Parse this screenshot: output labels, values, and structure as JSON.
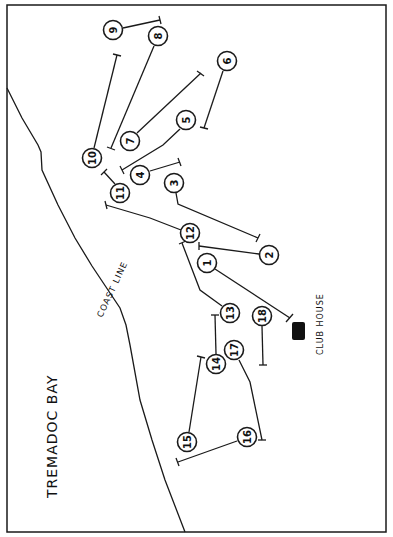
{
  "map": {
    "labels": {
      "bay": "TREMADOC BAY",
      "coast": "COAST LINE",
      "clubhouse": "CLUB HOUSE"
    },
    "colors": {
      "ink": "#1a1a1a",
      "paper": "#ffffff"
    },
    "holes": [
      {
        "n": "1",
        "x": 207,
        "y": 263
      },
      {
        "n": "2",
        "x": 269,
        "y": 255
      },
      {
        "n": "3",
        "x": 174,
        "y": 183
      },
      {
        "n": "4",
        "x": 140,
        "y": 175
      },
      {
        "n": "5",
        "x": 186,
        "y": 120
      },
      {
        "n": "6",
        "x": 227,
        "y": 61
      },
      {
        "n": "7",
        "x": 130,
        "y": 141
      },
      {
        "n": "8",
        "x": 158,
        "y": 36
      },
      {
        "n": "9",
        "x": 113,
        "y": 30
      },
      {
        "n": "10",
        "x": 92,
        "y": 158
      },
      {
        "n": "11",
        "x": 120,
        "y": 193
      },
      {
        "n": "12",
        "x": 190,
        "y": 233
      },
      {
        "n": "13",
        "x": 230,
        "y": 313
      },
      {
        "n": "14",
        "x": 216,
        "y": 364
      },
      {
        "n": "15",
        "x": 187,
        "y": 442
      },
      {
        "n": "16",
        "x": 247,
        "y": 437
      },
      {
        "n": "17",
        "x": 234,
        "y": 350
      },
      {
        "n": "18",
        "x": 262,
        "y": 316
      }
    ]
  }
}
